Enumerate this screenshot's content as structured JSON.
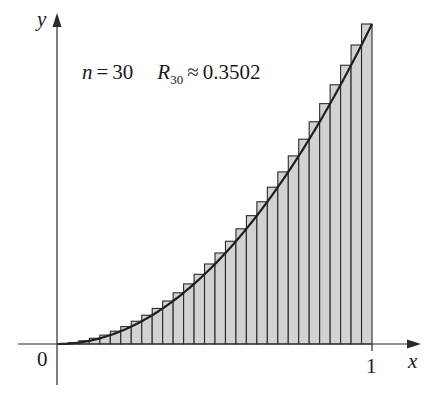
{
  "chart_data": {
    "type": "bar",
    "title": "",
    "annotation": {
      "n_label": "n",
      "eq": "=",
      "n_value": "30",
      "r_label": "R",
      "r_sub": "30",
      "approx": "≈",
      "r_value": "0.3502"
    },
    "function": "y = x^2",
    "method": "right-endpoint Riemann sum",
    "n": 30,
    "xlabel": "x",
    "ylabel": "y",
    "x_ticks": [
      {
        "value": 0,
        "label": "0"
      },
      {
        "value": 1,
        "label": "1"
      }
    ],
    "xlim": [
      0,
      1
    ],
    "ylim": [
      0,
      1
    ],
    "grid": false,
    "legend": "none",
    "bar_width": 0.0333,
    "categories": [
      "1/30",
      "2/30",
      "3/30",
      "4/30",
      "5/30",
      "6/30",
      "7/30",
      "8/30",
      "9/30",
      "10/30",
      "11/30",
      "12/30",
      "13/30",
      "14/30",
      "15/30",
      "16/30",
      "17/30",
      "18/30",
      "19/30",
      "20/30",
      "21/30",
      "22/30",
      "23/30",
      "24/30",
      "25/30",
      "26/30",
      "27/30",
      "28/30",
      "29/30",
      "30/30"
    ],
    "values": [
      0.0011,
      0.0044,
      0.01,
      0.0178,
      0.0278,
      0.04,
      0.0544,
      0.0711,
      0.09,
      0.1111,
      0.1344,
      0.16,
      0.1878,
      0.2178,
      0.25,
      0.2844,
      0.3211,
      0.36,
      0.4011,
      0.4444,
      0.49,
      0.5378,
      0.5878,
      0.64,
      0.6944,
      0.7511,
      0.81,
      0.8711,
      0.9344,
      1.0
    ],
    "colors": {
      "bar_fill": "#d2d2d2",
      "bar_stroke": "#2a2a2a",
      "curve": "#1e1e1e",
      "axis": "#2a2a2a"
    }
  }
}
